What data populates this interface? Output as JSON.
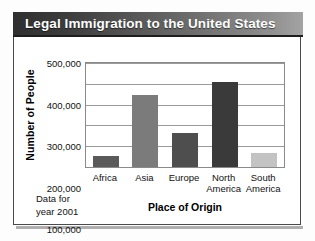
{
  "card": {
    "title": "Legal Immigration to the United States",
    "note_line1": "Data for",
    "note_line2": "year 2001"
  },
  "chart_data": {
    "type": "bar",
    "title": "Legal Immigration to the United States",
    "xlabel": "Place of Origin",
    "ylabel": "Number of People",
    "categories": [
      "Africa",
      "Asia",
      "Europe",
      "North America",
      "South America"
    ],
    "category_lines": [
      [
        "Africa"
      ],
      [
        "Asia"
      ],
      [
        "Europe"
      ],
      [
        "North",
        "America"
      ],
      [
        "South",
        "America"
      ]
    ],
    "values": [
      55000,
      348000,
      165000,
      408000,
      68000
    ],
    "bar_colors": [
      "#5a5a5a",
      "#7b7b7b",
      "#4e4e4e",
      "#3a3a3a",
      "#c3c3c3"
    ],
    "ylim": [
      0,
      500000
    ],
    "yticks": [
      100000,
      200000,
      300000,
      400000,
      500000
    ],
    "ytick_labels": [
      "100,000",
      "200,000",
      "300,000",
      "400,000",
      "500,000"
    ],
    "grid": true,
    "legend": false,
    "annotation": "Data for year 2001"
  }
}
